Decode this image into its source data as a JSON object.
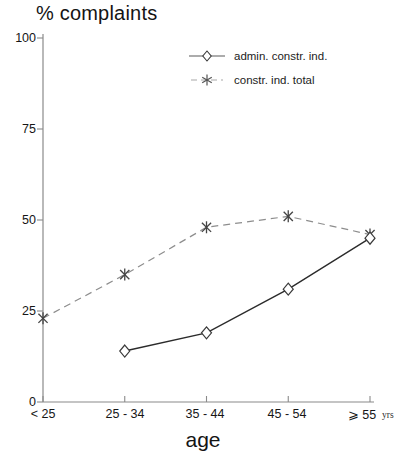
{
  "chart_data": {
    "type": "line",
    "title": "% complaints",
    "xlabel": "age",
    "ylabel": "",
    "x_unit": "yrs",
    "categories": [
      "< 25",
      "25 - 34",
      "35 - 44",
      "45 - 54",
      "⩾ 55"
    ],
    "y_ticks": [
      0,
      25,
      50,
      75,
      100
    ],
    "ylim": [
      0,
      100
    ],
    "grid": false,
    "legend_position": "top-right",
    "series": [
      {
        "name": "admin. constr. ind.",
        "values": [
          null,
          14,
          19,
          31,
          45
        ],
        "line_style": "solid",
        "marker": "diamond",
        "color": "#2b2b2b"
      },
      {
        "name": "constr. ind. total",
        "values": [
          23,
          35,
          48,
          51,
          46
        ],
        "line_style": "dashed",
        "marker": "asterisk",
        "color": "#8d8d8d"
      }
    ]
  },
  "legend": {
    "items": [
      {
        "label": "admin. constr. ind."
      },
      {
        "label": "constr. ind. total"
      }
    ]
  },
  "axis": {
    "y_tick_labels": [
      "100",
      "75",
      "50",
      "25",
      "0"
    ],
    "x_tick_labels": [
      "< 25",
      "25 - 34",
      "35 - 44",
      "45 - 54",
      "⩾ 55"
    ],
    "x_unit_label": "yrs"
  },
  "colors": {
    "axis": "#7c7c7c",
    "series_solid": "#2b2b2b",
    "series_dashed": "#9a9a9a",
    "text": "#141414"
  }
}
